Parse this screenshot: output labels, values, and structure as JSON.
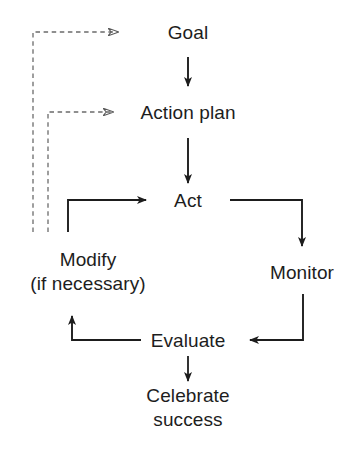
{
  "diagram": {
    "background_color": "#ffffff",
    "line_color": "#1d1d1d",
    "dashed_line_color": "#6b6b6b",
    "text_color": "#1d1d1d",
    "nodes": [
      {
        "id": "goal",
        "label": "Goal",
        "x": 188,
        "y": 32
      },
      {
        "id": "action",
        "label": "Action plan",
        "x": 188,
        "y": 112
      },
      {
        "id": "act",
        "label": "Act",
        "x": 188,
        "y": 200
      },
      {
        "id": "monitor",
        "label": "Monitor",
        "x": 302,
        "y": 272
      },
      {
        "id": "modify1",
        "label": "Modify",
        "x": 88,
        "y": 259
      },
      {
        "id": "modify2",
        "label": "(if necessary)",
        "x": 88,
        "y": 283
      },
      {
        "id": "evaluate",
        "label": "Evaluate",
        "x": 188,
        "y": 340
      },
      {
        "id": "celebrate1",
        "label": "Celebrate",
        "x": 188,
        "y": 395
      },
      {
        "id": "celebrate2",
        "label": "success",
        "x": 188,
        "y": 419
      }
    ],
    "edges": [
      {
        "id": "goal-to-action",
        "from": "Goal",
        "to": "Action plan",
        "style": "solid",
        "direction": "down"
      },
      {
        "id": "action-to-act",
        "from": "Action plan",
        "to": "Act",
        "style": "solid",
        "direction": "down"
      },
      {
        "id": "act-to-monitor",
        "from": "Act",
        "to": "Monitor",
        "style": "solid",
        "direction": "right-then-down"
      },
      {
        "id": "monitor-to-evaluate",
        "from": "Monitor",
        "to": "Evaluate",
        "style": "solid",
        "direction": "down-then-left"
      },
      {
        "id": "evaluate-to-celebrate",
        "from": "Evaluate",
        "to": "Celebrate success",
        "style": "solid",
        "direction": "down"
      },
      {
        "id": "evaluate-to-modify",
        "from": "Evaluate",
        "to": "Modify (if necessary)",
        "style": "solid",
        "direction": "left-then-up"
      },
      {
        "id": "modify-to-act",
        "from": "Modify (if necessary)",
        "to": "Act",
        "style": "solid",
        "direction": "up-then-right"
      },
      {
        "id": "modify-to-action-plan",
        "from": "Modify (if necessary)",
        "to": "Action plan",
        "style": "dashed",
        "direction": "up-then-right"
      },
      {
        "id": "modify-to-goal",
        "from": "Modify (if necessary)",
        "to": "Goal",
        "style": "dashed",
        "direction": "up-then-right"
      }
    ]
  }
}
